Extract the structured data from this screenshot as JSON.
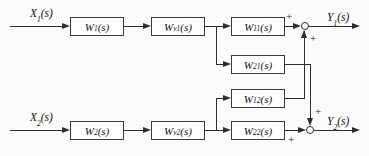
{
  "figure": {
    "type": "block-diagram",
    "inputs": {
      "x1": {
        "base": "X",
        "sub": "1",
        "arg": "(s)"
      },
      "x2": {
        "base": "X",
        "sub": "2",
        "arg": "(s)"
      }
    },
    "outputs": {
      "y1": {
        "base": "Y",
        "sub": "1",
        "arg": "(s)"
      },
      "y2": {
        "base": "Y",
        "sub": "2",
        "arg": "(s)"
      }
    },
    "blocks": {
      "w1": {
        "base": "W",
        "sub": "1",
        "arg": "(s)"
      },
      "wv1": {
        "base": "W",
        "sub": "v1",
        "arg": "(s)"
      },
      "w11": {
        "base": "W",
        "sub": "11",
        "arg": "(s)"
      },
      "w21": {
        "base": "W",
        "sub": "21",
        "arg": "(s)"
      },
      "w12": {
        "base": "W",
        "sub": "12",
        "arg": "(s)"
      },
      "w22": {
        "base": "W",
        "sub": "22",
        "arg": "(s)"
      },
      "w2": {
        "base": "W",
        "sub": "2",
        "arg": "(s)"
      },
      "wv2": {
        "base": "W",
        "sub": "v2",
        "arg": "(s)"
      }
    },
    "summing_junctions": {
      "sum1": {
        "horizontal_sign": "+",
        "vertical_sign": "+"
      },
      "sum2": {
        "horizontal_sign": "+",
        "vertical_sign": "+"
      }
    },
    "connections": [
      {
        "from": "x1",
        "to": "w1"
      },
      {
        "from": "w1",
        "to": "wv1"
      },
      {
        "from": "wv1",
        "to": "w11"
      },
      {
        "from": "wv1",
        "to": "w21"
      },
      {
        "from": "w11",
        "to": "sum1",
        "sign": "+"
      },
      {
        "from": "w12",
        "to": "sum1",
        "sign": "+"
      },
      {
        "from": "sum1",
        "to": "y1"
      },
      {
        "from": "x2",
        "to": "w2"
      },
      {
        "from": "w2",
        "to": "wv2"
      },
      {
        "from": "wv2",
        "to": "w12"
      },
      {
        "from": "wv2",
        "to": "w22"
      },
      {
        "from": "w21",
        "to": "sum2",
        "sign": "+"
      },
      {
        "from": "w22",
        "to": "sum2",
        "sign": "+"
      },
      {
        "from": "sum2",
        "to": "y2"
      }
    ],
    "colors": {
      "background": "#fbfbf9",
      "line": "#2e2e2e",
      "block_fill": "#ffffff",
      "block_border": "#3c3c3c",
      "text": "#111111"
    }
  }
}
